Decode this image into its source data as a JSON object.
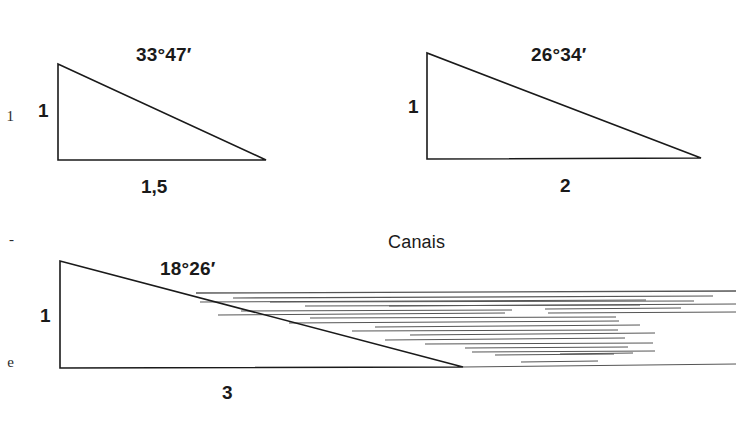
{
  "figure": {
    "title_label": "Canais",
    "background_color": "#ffffff",
    "stroke_color": "#1a1a1a",
    "hatch_color": "#555555",
    "margin_text_glyphs": [
      "1",
      "-",
      "e",
      "s",
      "e",
      "b",
      "a",
      "e",
      "a",
      "a"
    ],
    "triangles": [
      {
        "name": "slope-1-to-1.5",
        "angle_label": "33°47′",
        "vertical_label": "1",
        "base_label": "1,5",
        "apex": {
          "x": 58,
          "y": 64
        },
        "corner": {
          "x": 58,
          "y": 160
        },
        "tip": {
          "x": 266,
          "y": 160
        },
        "angle_label_pos": {
          "x": 136,
          "y": 44
        },
        "vertical_label_pos": {
          "x": 38,
          "y": 100
        },
        "base_label_pos": {
          "x": 141,
          "y": 176
        }
      },
      {
        "name": "slope-1-to-2",
        "angle_label": "26°34′",
        "vertical_label": "1",
        "base_label": "2",
        "apex": {
          "x": 427,
          "y": 53
        },
        "corner": {
          "x": 427,
          "y": 159
        },
        "tip": {
          "x": 701,
          "y": 158
        },
        "angle_label_pos": {
          "x": 531,
          "y": 44
        },
        "vertical_label_pos": {
          "x": 408,
          "y": 96
        },
        "base_label_pos": {
          "x": 560,
          "y": 175
        }
      },
      {
        "name": "slope-1-to-3",
        "angle_label": "18°26′",
        "vertical_label": "1",
        "base_label": "3",
        "apex": {
          "x": 60,
          "y": 261
        },
        "corner": {
          "x": 60,
          "y": 368
        },
        "tip": {
          "x": 463,
          "y": 367
        },
        "angle_label_pos": {
          "x": 160,
          "y": 258
        },
        "vertical_label_pos": {
          "x": 40,
          "y": 305
        },
        "base_label_pos": {
          "x": 222,
          "y": 382
        }
      }
    ],
    "canais_label_pos": {
      "x": 388,
      "y": 232
    },
    "canal_lines": [
      {
        "x1": 196,
        "y1": 293,
        "x2": 736,
        "y2": 291,
        "w": 1.3
      },
      {
        "x1": 233,
        "y1": 298,
        "x2": 713,
        "y2": 296,
        "w": 1.1
      },
      {
        "x1": 200,
        "y1": 302,
        "x2": 646,
        "y2": 300,
        "w": 1.0
      },
      {
        "x1": 270,
        "y1": 302,
        "x2": 694,
        "y2": 301,
        "w": 1.0
      },
      {
        "x1": 305,
        "y1": 306,
        "x2": 640,
        "y2": 305,
        "w": 1.0
      },
      {
        "x1": 389,
        "y1": 306,
        "x2": 736,
        "y2": 304,
        "w": 1.0
      },
      {
        "x1": 241,
        "y1": 311,
        "x2": 512,
        "y2": 310,
        "w": 1.0
      },
      {
        "x1": 545,
        "y1": 309,
        "x2": 681,
        "y2": 308,
        "w": 1.0
      },
      {
        "x1": 218,
        "y1": 315,
        "x2": 505,
        "y2": 313,
        "w": 1.0
      },
      {
        "x1": 548,
        "y1": 313,
        "x2": 736,
        "y2": 312,
        "w": 1.0
      },
      {
        "x1": 310,
        "y1": 318,
        "x2": 616,
        "y2": 317,
        "w": 1.0
      },
      {
        "x1": 289,
        "y1": 323,
        "x2": 619,
        "y2": 321,
        "w": 1.0
      },
      {
        "x1": 375,
        "y1": 327,
        "x2": 640,
        "y2": 325,
        "w": 1.0
      },
      {
        "x1": 352,
        "y1": 331,
        "x2": 618,
        "y2": 330,
        "w": 1.0
      },
      {
        "x1": 410,
        "y1": 335,
        "x2": 655,
        "y2": 333,
        "w": 1.0
      },
      {
        "x1": 385,
        "y1": 340,
        "x2": 625,
        "y2": 338,
        "w": 1.0
      },
      {
        "x1": 425,
        "y1": 344,
        "x2": 653,
        "y2": 343,
        "w": 1.0
      },
      {
        "x1": 465,
        "y1": 348,
        "x2": 628,
        "y2": 347,
        "w": 1.0
      },
      {
        "x1": 472,
        "y1": 352,
        "x2": 655,
        "y2": 351,
        "w": 1.0
      },
      {
        "x1": 495,
        "y1": 355,
        "x2": 614,
        "y2": 354,
        "w": 1.0
      },
      {
        "x1": 560,
        "y1": 354,
        "x2": 633,
        "y2": 353,
        "w": 1.0
      },
      {
        "x1": 521,
        "y1": 362,
        "x2": 598,
        "y2": 361,
        "w": 1.0
      },
      {
        "x1": 463,
        "y1": 367,
        "x2": 736,
        "y2": 364,
        "w": 1.0
      }
    ]
  }
}
